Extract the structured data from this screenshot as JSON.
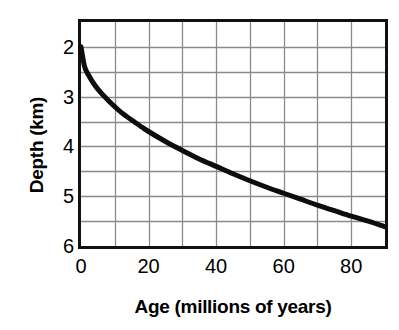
{
  "chart_data": {
    "type": "line",
    "title": "",
    "xlabel": "Age (millions of years)",
    "ylabel": "Depth (km)",
    "xlim": [
      0,
      90
    ],
    "ylim": [
      6.0,
      1.5
    ],
    "y_axis_inverted": true,
    "grid": true,
    "legend": null,
    "xticks": [
      0,
      20,
      40,
      60,
      80
    ],
    "xtick_labels": [
      "0",
      "20",
      "40",
      "60",
      "80"
    ],
    "yticks": [
      2,
      3,
      4,
      5,
      6
    ],
    "ytick_labels": [
      "2",
      "3",
      "4",
      "5",
      "6"
    ],
    "x_minor_gridline_step": 10,
    "y_minor_gridline_step": 0.5,
    "series": [
      {
        "name": "Ocean floor depth vs age",
        "x": [
          0,
          1,
          2,
          4,
          6,
          8,
          10,
          12,
          15,
          18,
          20,
          25,
          30,
          35,
          40,
          45,
          50,
          55,
          60,
          65,
          70,
          75,
          80,
          85,
          90
        ],
        "y": [
          2.0,
          2.38,
          2.54,
          2.76,
          2.93,
          3.07,
          3.2,
          3.32,
          3.47,
          3.61,
          3.7,
          3.9,
          4.08,
          4.25,
          4.4,
          4.55,
          4.69,
          4.82,
          4.94,
          5.06,
          5.18,
          5.29,
          5.4,
          5.5,
          5.61
        ]
      }
    ]
  },
  "axes": {
    "y_title": "Depth (km)",
    "x_title": "Age (millions of years)"
  },
  "style": {
    "curve_color": "#0d0d0d",
    "grid_color": "#8a8a8a",
    "border_color": "#111111",
    "background": "#ffffff"
  }
}
